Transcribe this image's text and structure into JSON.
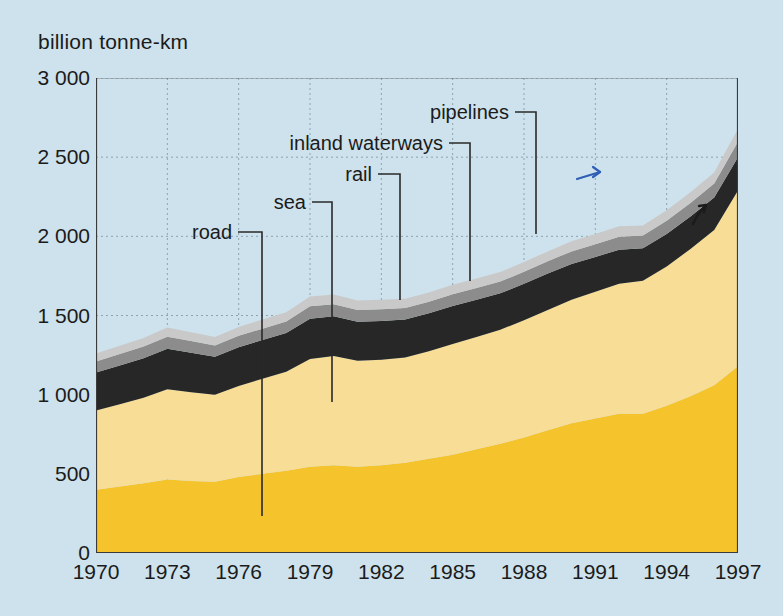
{
  "chart_data": {
    "type": "area",
    "title": "",
    "subtitle": "",
    "ylabel": "billion tonne-km",
    "xlabel": "",
    "ylim": [
      0,
      3000
    ],
    "xlim": [
      1970,
      1997
    ],
    "yticks": [
      "0",
      "500",
      "1 000",
      "1 500",
      "2 000",
      "2 500",
      "3 000"
    ],
    "ytick_values": [
      0,
      500,
      1000,
      1500,
      2000,
      2500,
      3000
    ],
    "xticks": [
      "1970",
      "1973",
      "1976",
      "1979",
      "1982",
      "1985",
      "1988",
      "1991",
      "1994",
      "1997"
    ],
    "xtick_values": [
      1970,
      1973,
      1976,
      1979,
      1982,
      1985,
      1988,
      1991,
      1994,
      1997
    ],
    "minor_xtick_interval": 1,
    "grid": true,
    "grid_style": "dotted",
    "stacked": true,
    "legend": "leader-line annotations",
    "x": [
      1970,
      1971,
      1972,
      1973,
      1974,
      1975,
      1976,
      1977,
      1978,
      1979,
      1980,
      1981,
      1982,
      1983,
      1984,
      1985,
      1986,
      1987,
      1988,
      1989,
      1990,
      1991,
      1992,
      1993,
      1994,
      1995,
      1996,
      1997
    ],
    "series": [
      {
        "name": "road",
        "color": "#f5c32c",
        "values": [
          400,
          420,
          440,
          465,
          455,
          450,
          480,
          500,
          520,
          545,
          555,
          545,
          555,
          570,
          595,
          620,
          655,
          690,
          730,
          775,
          820,
          850,
          880,
          880,
          930,
          990,
          1060,
          1180
        ]
      },
      {
        "name": "sea",
        "color": "#f7dd95",
        "values": [
          500,
          520,
          540,
          570,
          560,
          550,
          575,
          600,
          625,
          680,
          690,
          670,
          665,
          665,
          680,
          700,
          710,
          720,
          740,
          760,
          780,
          800,
          820,
          840,
          880,
          930,
          980,
          1110
        ]
      },
      {
        "name": "rail",
        "color": "#272727",
        "values": [
          240,
          245,
          250,
          255,
          250,
          240,
          245,
          245,
          245,
          255,
          250,
          245,
          245,
          240,
          240,
          240,
          235,
          230,
          230,
          230,
          225,
          220,
          215,
          205,
          205,
          205,
          205,
          210
        ]
      },
      {
        "name": "inland waterways",
        "color": "#8c8c8c",
        "values": [
          70,
          72,
          74,
          76,
          74,
          70,
          72,
          72,
          72,
          78,
          76,
          74,
          74,
          72,
          72,
          74,
          74,
          74,
          76,
          78,
          80,
          80,
          82,
          80,
          84,
          86,
          88,
          98
        ]
      },
      {
        "name": "pipelines",
        "color": "#c9c9c9",
        "values": [
          50,
          52,
          54,
          58,
          56,
          54,
          56,
          58,
          58,
          62,
          62,
          60,
          60,
          58,
          58,
          60,
          60,
          60,
          62,
          62,
          64,
          64,
          66,
          64,
          66,
          68,
          70,
          82
        ]
      }
    ],
    "totals_note": "bands stack bottom-to-top: road, sea, rail, inland waterways, pipelines",
    "annotations": [
      {
        "label": "road",
        "label_x": 238,
        "label_y": 232,
        "tip_x": 262,
        "tip_y": 516
      },
      {
        "label": "sea",
        "label_x": 312,
        "label_y": 202,
        "tip_x": 332,
        "tip_y": 402
      },
      {
        "label": "rail",
        "label_x": 378,
        "label_y": 174,
        "tip_x": 400,
        "tip_y": 300
      },
      {
        "label": "inland waterways",
        "label_x": 449,
        "label_y": 143,
        "tip_x": 470,
        "tip_y": 281
      },
      {
        "label": "pipelines",
        "label_x": 515,
        "label_y": 112,
        "tip_x": 536,
        "tip_y": 234
      }
    ],
    "marks": [
      {
        "type": "blue-arrow-annotation",
        "color": "#2f5fb5",
        "x": 589,
        "y": 175
      },
      {
        "type": "pen-arrow-annotation",
        "color": "#1b1b1b",
        "x": 700,
        "y": 214
      }
    ],
    "colors": {
      "background": "#cde2ec",
      "axis": "#3a3a3a",
      "grid": "#7a8f99",
      "text": "#1b1b1b"
    }
  }
}
